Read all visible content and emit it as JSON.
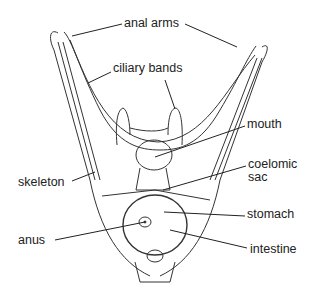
{
  "diagram": {
    "labels": [
      {
        "id": "anal-arms",
        "text": "anal arms",
        "x": 124,
        "y": 17
      },
      {
        "id": "ciliary-bands",
        "text": "ciliary bands",
        "x": 113,
        "y": 62
      },
      {
        "id": "mouth",
        "text": "mouth",
        "x": 247,
        "y": 118
      },
      {
        "id": "coelomic-sac-1",
        "text": "coelomic",
        "x": 248,
        "y": 158
      },
      {
        "id": "coelomic-sac-2",
        "text": "sac",
        "x": 248,
        "y": 171
      },
      {
        "id": "skeleton",
        "text": "skeleton",
        "x": 18,
        "y": 176
      },
      {
        "id": "stomach",
        "text": "stomach",
        "x": 247,
        "y": 208
      },
      {
        "id": "anus",
        "text": "anus",
        "x": 18,
        "y": 234
      },
      {
        "id": "intestine",
        "text": "intestine",
        "x": 250,
        "y": 243
      }
    ]
  }
}
